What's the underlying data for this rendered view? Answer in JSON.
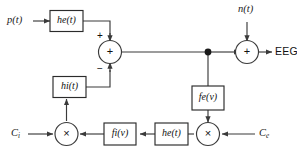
{
  "diagram": {
    "colors": {
      "line": "#3a3a3a",
      "box_stroke": "#2b2b2b",
      "box_fill": "#ffffff",
      "text": "#111111",
      "background": "#ffffff"
    },
    "inputs": [
      {
        "id": "p",
        "label_main": "p",
        "label_arg": "(t)",
        "full": "p(t)"
      },
      {
        "id": "n",
        "label_main": "n",
        "label_arg": "(t)",
        "full": "n(t)"
      },
      {
        "id": "Ci",
        "label_main": "C",
        "label_sub": "i",
        "full": "Ci"
      },
      {
        "id": "Ce",
        "label_main": "C",
        "label_sub": "e",
        "full": "Ce"
      }
    ],
    "outputs": [
      {
        "id": "eeg",
        "label": "EEG"
      }
    ],
    "blocks": [
      {
        "id": "he_top",
        "label_main": "h",
        "label_sub": "e",
        "label_arg": "(t)",
        "full": "he(t)"
      },
      {
        "id": "hi",
        "label_main": "h",
        "label_sub": "i",
        "label_arg": "(t)",
        "full": "hi(t)"
      },
      {
        "id": "fe",
        "label_main": "f",
        "label_sub": "e",
        "label_arg": "(v)",
        "full": "fe(v)"
      },
      {
        "id": "fi",
        "label_main": "f",
        "label_sub": "i",
        "label_arg": "(v)",
        "full": "fi(v)"
      },
      {
        "id": "he_bottom",
        "label_main": "h",
        "label_sub": "e",
        "label_arg": "(t)",
        "full": "he(t)"
      }
    ],
    "nodes": [
      {
        "id": "sum_left",
        "type": "summing-junction",
        "symbol": "+",
        "sign_plus": "+",
        "sign_minus": "−"
      },
      {
        "id": "sum_right",
        "type": "summing-junction",
        "symbol": "+"
      },
      {
        "id": "mult_left",
        "type": "multiplier",
        "symbol": "×"
      },
      {
        "id": "mult_right",
        "type": "multiplier",
        "symbol": "×"
      },
      {
        "id": "tap",
        "type": "junction-dot",
        "symbol": "•"
      }
    ]
  }
}
